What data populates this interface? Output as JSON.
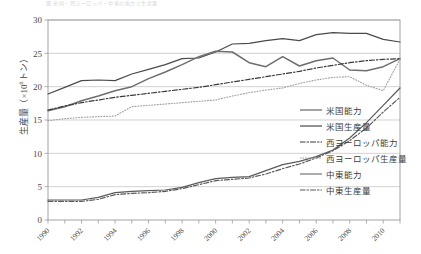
{
  "figure": {
    "top_caption": "図 米国・西ヨーロッパ・中東の能力と生産量",
    "y_axis_title_main": "生産量",
    "y_axis_title_unit_prefix": "（×10",
    "y_axis_title_unit_exp": "6",
    "y_axis_title_unit_suffix": "トン）"
  },
  "chart_data": {
    "type": "line",
    "title": "",
    "xlabel": "",
    "ylabel": "生産量（×10⁶トン）",
    "xlim": [
      1990,
      2011
    ],
    "ylim": [
      0,
      30
    ],
    "yticks": [
      0,
      5,
      10,
      15,
      20,
      25,
      30
    ],
    "ytick_labels": [
      "0",
      "5",
      "10",
      "15",
      "20",
      "25",
      "30"
    ],
    "xticks": [
      1990,
      1992,
      1994,
      1996,
      1998,
      2000,
      2002,
      2004,
      2006,
      2008,
      2010
    ],
    "xtick_labels": [
      "1990",
      "1992",
      "1994",
      "1996",
      "1998",
      "2000",
      "2002",
      "2004",
      "2006",
      "2008",
      "2010"
    ],
    "x": [
      1990,
      1991,
      1992,
      1993,
      1994,
      1995,
      1996,
      1997,
      1998,
      1999,
      2000,
      2001,
      2002,
      2003,
      2004,
      2005,
      2006,
      2007,
      2008,
      2009,
      2010,
      2011
    ],
    "grid": "horizontal",
    "legend_position": "right",
    "series": [
      {
        "name": "米国能力",
        "style": "solid",
        "color": "#4a4a4a",
        "width": 1.2,
        "values": [
          18.9,
          19.9,
          20.9,
          21.0,
          20.9,
          21.9,
          22.6,
          23.3,
          24.2,
          24.3,
          25.2,
          26.4,
          26.5,
          26.9,
          27.2,
          26.9,
          27.8,
          28.1,
          28.0,
          28.0,
          27.1,
          26.7
        ]
      },
      {
        "name": "米国生産量",
        "style": "solid",
        "color": "#6e6e6e",
        "width": 1.5,
        "values": [
          16.4,
          17.0,
          17.9,
          18.6,
          19.4,
          20.0,
          21.2,
          22.2,
          23.3,
          24.5,
          25.3,
          25.2,
          23.6,
          23.0,
          24.5,
          23.1,
          23.9,
          24.3,
          22.5,
          22.4,
          23.0,
          24.2
        ]
      },
      {
        "name": "西ヨーロッパ能力",
        "style": "dashdot",
        "color": "#3a3a3a",
        "width": 1.2,
        "values": [
          16.5,
          17.1,
          17.6,
          18.0,
          18.4,
          18.7,
          19.0,
          19.3,
          19.6,
          19.9,
          20.3,
          20.7,
          21.1,
          21.5,
          21.9,
          22.3,
          22.8,
          23.2,
          23.6,
          23.9,
          24.1,
          24.2
        ]
      },
      {
        "name": "西ヨーロッパ生産量",
        "style": "dotted",
        "color": "#a0a0a0",
        "width": 1.1,
        "values": [
          14.9,
          15.2,
          15.4,
          15.5,
          15.6,
          17.0,
          17.2,
          17.4,
          17.6,
          17.8,
          18.0,
          18.6,
          19.1,
          19.5,
          19.8,
          20.5,
          21.0,
          21.4,
          21.5,
          20.2,
          19.4,
          24.1
        ]
      },
      {
        "name": "中東能力",
        "style": "solid",
        "color": "#5a5a5a",
        "width": 1.2,
        "values": [
          3.0,
          3.0,
          3.0,
          3.4,
          4.1,
          4.3,
          4.4,
          4.5,
          4.9,
          5.6,
          6.2,
          6.4,
          6.5,
          7.4,
          8.3,
          8.8,
          9.5,
          10.5,
          12.3,
          14.6,
          17.2,
          19.8
        ]
      },
      {
        "name": "中東生産量",
        "style": "dashdot",
        "color": "#5a5a5a",
        "width": 1.2,
        "values": [
          2.8,
          2.8,
          2.8,
          3.1,
          3.8,
          4.0,
          4.1,
          4.3,
          4.7,
          5.3,
          5.9,
          6.1,
          6.3,
          6.9,
          7.7,
          8.4,
          9.3,
          10.4,
          11.9,
          13.8,
          16.2,
          18.4
        ]
      }
    ]
  },
  "legend": {
    "items": [
      {
        "label": "米国能力",
        "style": "solid"
      },
      {
        "label": "米国生産量",
        "style": "solid"
      },
      {
        "label": "西ヨーロッパ能力",
        "style": "dashdot"
      },
      {
        "label": "西ヨーロッパ生産量",
        "style": "dotted"
      },
      {
        "label": "中東能力",
        "style": "solid"
      },
      {
        "label": "中東生産量",
        "style": "dashdot"
      }
    ]
  }
}
